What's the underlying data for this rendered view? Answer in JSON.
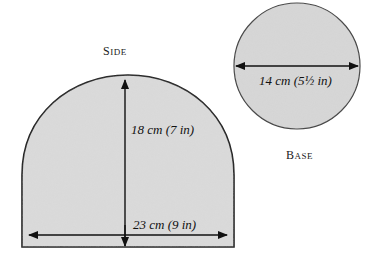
{
  "side": {
    "title": "Side",
    "title_caps": {
      "first": "S",
      "rest": "IDE"
    },
    "height_label": "18 cm (7 in)",
    "width_label": "23 cm (9 in)"
  },
  "base": {
    "title": "Base",
    "title_caps": {
      "first": "B",
      "rest": "ASE"
    },
    "diameter_label": "14 cm (5½ in)"
  },
  "colors": {
    "fill": "#d6d6d6",
    "outline": "#222222",
    "arrow": "#111111"
  }
}
